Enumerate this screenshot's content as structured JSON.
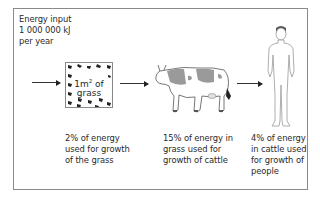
{
  "diagram": {
    "energy_input": {
      "lines": [
        "Energy input",
        "1 000 000 kJ",
        "per year"
      ]
    },
    "stages": [
      {
        "name": "grass",
        "label_main": "1m",
        "label_sup": "2",
        "label_rest": " of",
        "label_line2": "grass",
        "caption": [
          "2% of energy",
          "used for growth",
          "of the grass"
        ]
      },
      {
        "name": "cattle",
        "caption": [
          "15% of energy in",
          "grass used for",
          "growth of cattle"
        ]
      },
      {
        "name": "people",
        "caption": [
          "4% of energy",
          "in cattle used",
          "for growth of",
          "people"
        ]
      }
    ],
    "colors": {
      "frame": "#8a8a8a",
      "text": "#2a2a2a",
      "cow_patch": "#9a9a9a",
      "outline": "#555555"
    }
  }
}
